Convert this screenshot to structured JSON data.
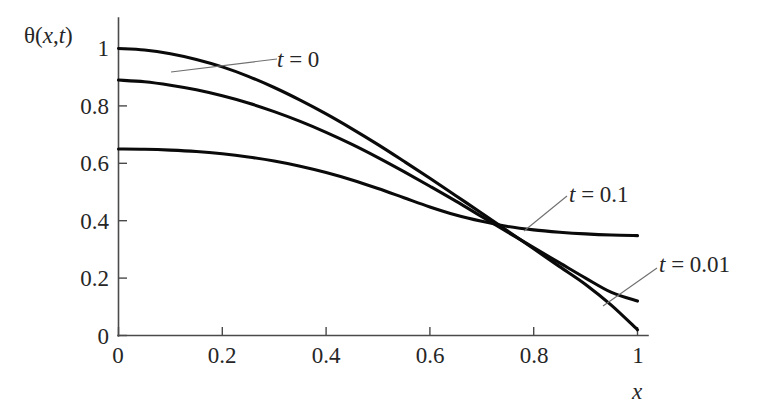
{
  "figure": {
    "background_color": "#ffffff",
    "curve_color": "#0a0a0a",
    "axis_color": "#4a4a4a",
    "leader_color": "#6f6f6f"
  },
  "axes": {
    "y_title": "θ(x,t)",
    "x_title": "x",
    "x_ticks": [
      "0",
      "0.2",
      "0.4",
      "0.6",
      "0.8",
      "1"
    ],
    "x_tick_values": [
      0,
      0.2,
      0.4,
      0.6,
      0.8,
      1
    ],
    "y_ticks": [
      "0",
      "0.2",
      "0.4",
      "0.6",
      "0.8",
      "1"
    ],
    "y_tick_values": [
      0,
      0.2,
      0.4,
      0.6,
      0.8,
      1
    ]
  },
  "annotations": {
    "t0": {
      "var": "t",
      "eq": " = 0"
    },
    "t01": {
      "var": "t",
      "eq": " = 0.1"
    },
    "t001": {
      "var": "t",
      "eq": " = 0.01"
    }
  },
  "chart_data": {
    "type": "line",
    "title": "",
    "xlabel": "x",
    "ylabel": "θ(x,t)",
    "xlim": [
      0,
      1
    ],
    "ylim": [
      0,
      1
    ],
    "grid": false,
    "legend": "inline-annotations",
    "x": [
      0,
      0.05,
      0.1,
      0.15,
      0.2,
      0.25,
      0.3,
      0.35,
      0.4,
      0.45,
      0.5,
      0.55,
      0.6,
      0.65,
      0.7,
      0.75,
      0.8,
      0.85,
      0.9,
      0.95,
      1
    ],
    "series": [
      {
        "name": "t = 0",
        "label": "t = 0",
        "values": [
          1.0,
          0.995,
          0.982,
          0.962,
          0.936,
          0.903,
          0.864,
          0.82,
          0.772,
          0.72,
          0.665,
          0.607,
          0.548,
          0.487,
          0.426,
          0.364,
          0.302,
          0.24,
          0.178,
          0.105,
          0.02
        ]
      },
      {
        "name": "t = 0.01",
        "label": "t = 0.01",
        "values": [
          0.89,
          0.884,
          0.872,
          0.856,
          0.835,
          0.81,
          0.78,
          0.746,
          0.708,
          0.666,
          0.62,
          0.571,
          0.52,
          0.468,
          0.414,
          0.36,
          0.306,
          0.253,
          0.2,
          0.15,
          0.12
        ]
      },
      {
        "name": "t = 0.1",
        "label": "t = 0.1",
        "values": [
          0.65,
          0.649,
          0.646,
          0.641,
          0.633,
          0.622,
          0.608,
          0.59,
          0.568,
          0.542,
          0.512,
          0.48,
          0.448,
          0.42,
          0.398,
          0.38,
          0.368,
          0.36,
          0.354,
          0.35,
          0.348
        ]
      }
    ],
    "notes": {
      "crossing_point": [
        0.5,
        0.5
      ],
      "endpoints_at_x1": {
        "t = 0": 0.02,
        "t = 0.01": 0.12,
        "t = 0.1": 0.348
      },
      "startpoints_at_x0": {
        "t = 0": 1.0,
        "t = 0.01": 0.89,
        "t = 0.1": 0.65
      }
    }
  }
}
